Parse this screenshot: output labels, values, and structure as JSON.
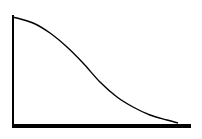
{
  "chart_data": {
    "type": "line",
    "title": "",
    "xlabel": "",
    "ylabel": "",
    "grid": false,
    "legend": null,
    "series": [
      {
        "name": "curve",
        "x": [
          0,
          0.11,
          0.21,
          0.31,
          0.4,
          0.5,
          0.6,
          0.69,
          0.79,
          0.88,
          0.94
        ],
        "y": [
          1.0,
          0.94,
          0.85,
          0.72,
          0.58,
          0.41,
          0.27,
          0.18,
          0.11,
          0.06,
          0.03
        ]
      }
    ],
    "xlim": [
      0,
      1
    ],
    "ylim": [
      0,
      1.0
    ],
    "pixel_points": [
      [
        13,
        17
      ],
      [
        33,
        23
      ],
      [
        50,
        33
      ],
      [
        67,
        47
      ],
      [
        83,
        63
      ],
      [
        100,
        82
      ],
      [
        117,
        97
      ],
      [
        133,
        107
      ],
      [
        150,
        115
      ],
      [
        167,
        120
      ],
      [
        178,
        123
      ]
    ],
    "colors": {
      "line": "#000000",
      "axis": "#000000",
      "background": "#ffffff"
    }
  }
}
